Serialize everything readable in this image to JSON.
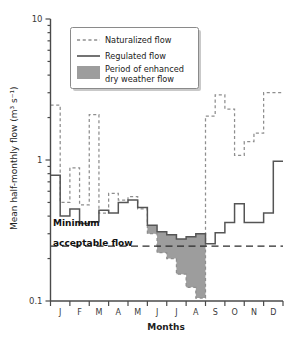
{
  "chart_data": {
    "type": "line",
    "title": "",
    "xlabel": "Months",
    "ylabel": "Mean half-monthly flow (m³ s⁻¹)",
    "yscale": "log",
    "ylim": [
      0.1,
      10
    ],
    "ytick_labels": [
      "10",
      "1",
      "0.1"
    ],
    "ytick_values": [
      10,
      1,
      0.1
    ],
    "xtick_labels": [
      "J",
      "F",
      "M",
      "A",
      "M",
      "J",
      "J",
      "A",
      "S",
      "O",
      "N",
      "D"
    ],
    "xlim": [
      0,
      24
    ],
    "grid": false,
    "legend_position": "top-right",
    "legend": [
      {
        "key": "naturalized",
        "label": "Naturalized flow",
        "style": "dashed-line",
        "color": "#8e8e8e"
      },
      {
        "key": "regulated",
        "label": "Regulated flow",
        "style": "solid-line",
        "color": "#444444"
      },
      {
        "key": "enhanced",
        "label": "Period of enhanced\ndry weather flow",
        "label_line1": "Period of enhanced",
        "label_line2": "dry weather flow",
        "style": "filled-swatch",
        "color": "#9d9d9d"
      }
    ],
    "annotations": [
      {
        "key": "minimum-acceptable-flow",
        "label_line1": "Minimum",
        "label_line2": "acceptable flow",
        "value": 0.245,
        "style": "dashed-horizontal-line"
      }
    ],
    "x_periods": [
      "Jan-1",
      "Jan-2",
      "Feb-1",
      "Feb-2",
      "Mar-1",
      "Mar-2",
      "Apr-1",
      "Apr-2",
      "May-1",
      "May-2",
      "Jun-1",
      "Jun-2",
      "Jul-1",
      "Jul-2",
      "Aug-1",
      "Aug-2",
      "Sep-1",
      "Sep-2",
      "Oct-1",
      "Oct-2",
      "Nov-1",
      "Nov-2",
      "Dec-1",
      "Dec-2"
    ],
    "series": [
      {
        "name": "Naturalized flow",
        "key": "naturalized",
        "values": [
          2.45,
          0.5,
          0.88,
          0.48,
          2.1,
          0.42,
          0.58,
          0.52,
          0.55,
          0.45,
          0.3,
          0.22,
          0.2,
          0.155,
          0.125,
          0.105,
          2.05,
          2.9,
          2.3,
          1.08,
          1.35,
          1.55,
          3.0,
          3.0
        ]
      },
      {
        "name": "Regulated flow",
        "key": "regulated",
        "values": [
          0.78,
          0.4,
          0.45,
          0.355,
          0.365,
          0.44,
          0.42,
          0.5,
          0.52,
          0.46,
          0.345,
          0.31,
          0.295,
          0.275,
          0.285,
          0.3,
          0.255,
          0.305,
          0.36,
          0.49,
          0.36,
          0.36,
          0.42,
          0.98
        ]
      }
    ],
    "shaded_region": {
      "name": "Period of enhanced dry weather flow",
      "key": "enhanced",
      "start_period": "Jun-1",
      "end_period": "Sep-1",
      "start_index": 10,
      "end_index": 16,
      "upper_series": "regulated",
      "lower_series": "naturalized",
      "color": "#9d9d9d"
    }
  }
}
